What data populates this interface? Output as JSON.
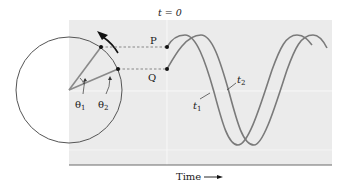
{
  "labels": {
    "t0": "t = 0",
    "point_p": "P",
    "point_q": "Q",
    "theta1": "θ",
    "theta1_sub": "1",
    "theta2": "θ",
    "theta2_sub": "2",
    "curve_t1": "t",
    "curve_t1_sub": "1",
    "curve_t2": "t",
    "curve_t2_sub": "2",
    "time_axis": "Time"
  },
  "colors": {
    "panel": "#ebebeb",
    "curve": "#7a7a7a",
    "circle": "#555555",
    "dot": "#111111",
    "axis": "#6a6a6a"
  }
}
